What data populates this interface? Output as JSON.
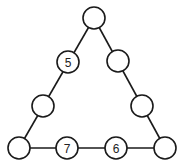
{
  "diagram": {
    "type": "triangle-number-puzzle",
    "nodes": [
      {
        "id": "top",
        "x": 94,
        "y": 18,
        "label": ""
      },
      {
        "id": "left-upper",
        "x": 68,
        "y": 62,
        "label": "5"
      },
      {
        "id": "right-upper",
        "x": 118,
        "y": 61,
        "label": ""
      },
      {
        "id": "left-lower",
        "x": 43,
        "y": 106,
        "label": ""
      },
      {
        "id": "right-lower",
        "x": 142,
        "y": 106,
        "label": ""
      },
      {
        "id": "bottom-left",
        "x": 19,
        "y": 148,
        "label": ""
      },
      {
        "id": "bottom-mid-left",
        "x": 67,
        "y": 148,
        "label": "7"
      },
      {
        "id": "bottom-mid-right",
        "x": 116,
        "y": 148,
        "label": "6"
      },
      {
        "id": "bottom-right",
        "x": 165,
        "y": 148,
        "label": ""
      }
    ],
    "node_radius": 11,
    "line_color": "#1a1a1a",
    "background": "#ffffff"
  }
}
